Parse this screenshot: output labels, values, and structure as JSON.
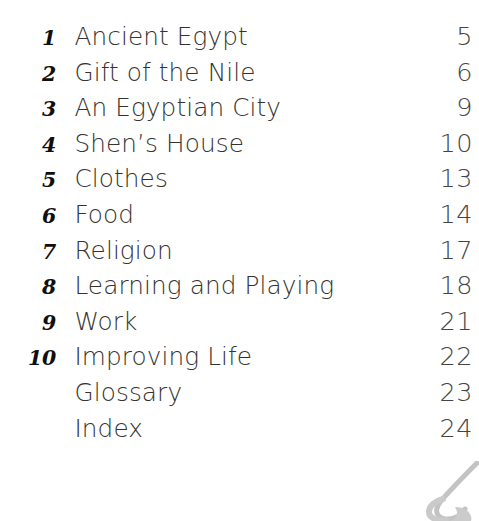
{
  "document": {
    "page_type": "table-of-contents",
    "background_color": "#ffffff",
    "text_color": "#35332f",
    "number_color": "#100f0d"
  },
  "contents": {
    "entries": [
      {
        "number": "1",
        "title": "Ancient Egypt",
        "page": "5"
      },
      {
        "number": "2",
        "title": "Gift of the Nile",
        "page": "6"
      },
      {
        "number": "3",
        "title": "An Egyptian City",
        "page": "9"
      },
      {
        "number": "4",
        "title": "Shen’s House",
        "page": "10"
      },
      {
        "number": "5",
        "title": "Clothes",
        "page": "13"
      },
      {
        "number": "6",
        "title": "Food",
        "page": "14"
      },
      {
        "number": "7",
        "title": "Religion",
        "page": "17"
      },
      {
        "number": "8",
        "title": "Learning and Playing",
        "page": "18"
      },
      {
        "number": "9",
        "title": "Work",
        "page": "21"
      },
      {
        "number": "10",
        "title": "Improving Life",
        "page": "22"
      },
      {
        "number": "",
        "title": "Glossary",
        "page": "23"
      },
      {
        "number": "",
        "title": "Index",
        "page": "24"
      }
    ]
  },
  "decoration": {
    "corner_mark": "swirl-graphic",
    "corner_mark_color": "#8d8d8d"
  }
}
